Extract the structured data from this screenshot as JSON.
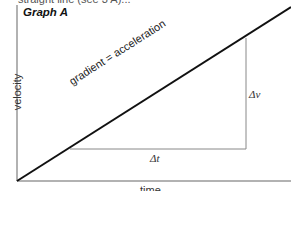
{
  "header": {
    "cut_text": "straight line (see 3 A)...",
    "title": "Graph A"
  },
  "axes": {
    "x_label": "time",
    "y_label": "velocity"
  },
  "annotations": {
    "line_label": "gradient = acceleration",
    "delta_v": "Δv",
    "delta_t": "Δt"
  },
  "colors": {
    "line": "#111111",
    "axes": "#999999",
    "triangle": "#888888"
  }
}
